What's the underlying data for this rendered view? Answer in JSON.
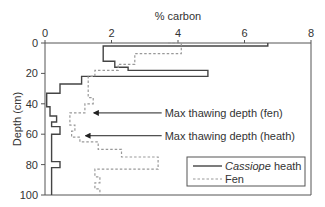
{
  "chart_data": {
    "type": "line",
    "title": "",
    "xlabel": "% carbon",
    "ylabel": "Depth (cm)",
    "xlim": [
      0,
      8
    ],
    "ylim": [
      0,
      100
    ],
    "y_inverted": true,
    "x_axis_position": "top",
    "x_ticks": [
      0,
      2,
      4,
      6,
      8
    ],
    "y_ticks": [
      0,
      20,
      40,
      60,
      80,
      100
    ],
    "grid": false,
    "legend_position": "lower right",
    "series": [
      {
        "name": "Cassiope heath",
        "name_italic": "Cassiope",
        "name_rest": " heath",
        "style": "solid",
        "color": "#444444",
        "step_points": [
          [
            6.7,
            0
          ],
          [
            6.7,
            2
          ],
          [
            1.75,
            2
          ],
          [
            1.75,
            12
          ],
          [
            2.1,
            12
          ],
          [
            2.1,
            16
          ],
          [
            2.5,
            16
          ],
          [
            2.5,
            18
          ],
          [
            4.9,
            18
          ],
          [
            4.9,
            22
          ],
          [
            1.1,
            22
          ],
          [
            1.1,
            27
          ],
          [
            0.45,
            27
          ],
          [
            0.45,
            33
          ],
          [
            0.05,
            33
          ],
          [
            0.05,
            42
          ],
          [
            0.15,
            42
          ],
          [
            0.15,
            48
          ],
          [
            0.35,
            48
          ],
          [
            0.35,
            52
          ],
          [
            0.2,
            52
          ],
          [
            0.2,
            55
          ],
          [
            0.45,
            55
          ],
          [
            0.45,
            60
          ],
          [
            0.2,
            60
          ],
          [
            0.2,
            78
          ],
          [
            0.45,
            78
          ],
          [
            0.45,
            82
          ],
          [
            0.2,
            82
          ],
          [
            0.2,
            100
          ]
        ]
      },
      {
        "name": "Fen",
        "style": "dashed",
        "color": "#999999",
        "step_points": [
          [
            3.7,
            0
          ],
          [
            4.1,
            0
          ],
          [
            4.1,
            7
          ],
          [
            2.7,
            7
          ],
          [
            2.7,
            14
          ],
          [
            2.2,
            14
          ],
          [
            2.2,
            18
          ],
          [
            1.5,
            18
          ],
          [
            1.5,
            22
          ],
          [
            1.3,
            22
          ],
          [
            1.3,
            36
          ],
          [
            1.45,
            36
          ],
          [
            1.45,
            40
          ],
          [
            1.2,
            40
          ],
          [
            1.2,
            46
          ],
          [
            0.75,
            46
          ],
          [
            0.75,
            54
          ],
          [
            0.9,
            54
          ],
          [
            0.9,
            58
          ],
          [
            0.8,
            58
          ],
          [
            0.8,
            62
          ],
          [
            1.05,
            62
          ],
          [
            1.05,
            65
          ],
          [
            1.6,
            65
          ],
          [
            1.6,
            70
          ],
          [
            2.3,
            70
          ],
          [
            2.3,
            75
          ],
          [
            3.4,
            75
          ],
          [
            3.4,
            83
          ],
          [
            1.5,
            83
          ],
          [
            1.5,
            88
          ],
          [
            1.65,
            88
          ],
          [
            1.65,
            92
          ],
          [
            1.5,
            92
          ],
          [
            1.5,
            96
          ],
          [
            1.65,
            96
          ],
          [
            1.65,
            100
          ]
        ]
      }
    ],
    "annotations": [
      {
        "text": "Max thawing depth (fen)",
        "arrow_depth": 46,
        "arrow_x": 1.35,
        "text_x": 3.6
      },
      {
        "text": "Max thawing depth (heath)",
        "arrow_depth": 61,
        "arrow_x": 1.1,
        "text_x": 3.6
      }
    ]
  }
}
